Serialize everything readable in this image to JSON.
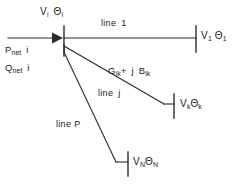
{
  "diagram": {
    "stroke_color": "#2b2b2b",
    "text_color": "#1a1a1a",
    "background": "#ffffff",
    "bus_i": {
      "voltage_symbol": "V",
      "voltage_sub": "i",
      "angle_symbol": "Θ",
      "angle_sub": "i",
      "label": "V",
      "label2": "Θ"
    },
    "injections": [
      {
        "symbol": "P",
        "sub": "net",
        "index": "i"
      },
      {
        "symbol": "Q",
        "sub": "net",
        "index": "i"
      }
    ],
    "lines": [
      {
        "name": "line-1",
        "label": "line",
        "number": "1"
      },
      {
        "name": "line-j",
        "label": "line",
        "number": "j"
      },
      {
        "name": "line-P",
        "label": "line",
        "number": "P"
      }
    ],
    "admittance": {
      "g_symbol": "G",
      "g_sub": "ik",
      "plus": "+",
      "j_symbol": "j",
      "b_symbol": "B",
      "b_sub": "ik"
    },
    "terminals": [
      {
        "name": "bus-1",
        "voltage": "V",
        "v_sub": "1",
        "angle": "Θ",
        "a_sub": "1"
      },
      {
        "name": "bus-k",
        "voltage": "V",
        "v_sub": "k",
        "angle": "Θ",
        "a_sub": "k"
      },
      {
        "name": "bus-N",
        "voltage": "V",
        "v_sub": "N",
        "angle": "Θ",
        "a_sub": "N"
      }
    ]
  }
}
